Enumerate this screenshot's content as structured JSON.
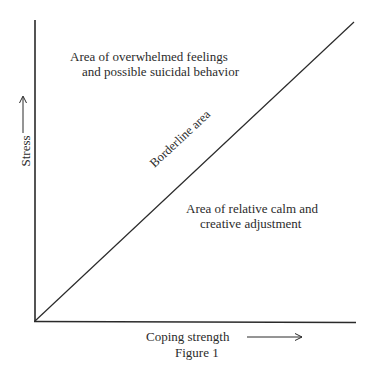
{
  "figure": {
    "caption": "Figure 1",
    "x_axis_label": "Coping strength",
    "y_axis_label": "Stress",
    "diagonal_label": "Borderline area",
    "upper_region": {
      "line1": "Area of overwhelmed feelings",
      "line2": "and possible suicidal behavior"
    },
    "lower_region": {
      "line1": "Area of relative calm and",
      "line2": "creative adjustment"
    }
  },
  "colors": {
    "line": "#2a2a2a",
    "background": "#ffffff"
  }
}
